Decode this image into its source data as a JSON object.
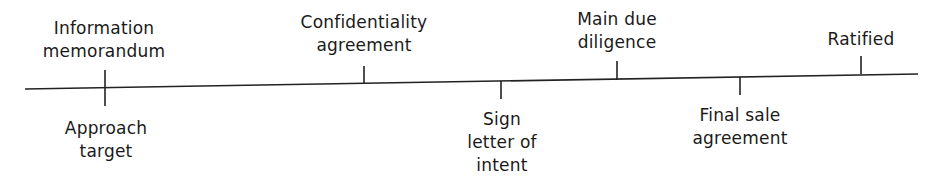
{
  "diagram": {
    "type": "timeline",
    "line": {
      "x1": 25,
      "y1": 89,
      "x2": 918,
      "y2": 74,
      "color": "#222222"
    },
    "events": [
      {
        "id": "approach-target",
        "label": "Approach\ntarget",
        "x": 105,
        "side": "below",
        "order": 1
      },
      {
        "id": "information-memorandum",
        "label": "Information\nmemorandum",
        "x": 105,
        "side": "above",
        "order": 2
      },
      {
        "id": "confidentiality-agreement",
        "label": "Confidentiality\nagreement",
        "x": 364,
        "side": "above",
        "order": 3
      },
      {
        "id": "sign-letter-of-intent",
        "label": "Sign\nletter of\nintent",
        "x": 501,
        "side": "below",
        "order": 4
      },
      {
        "id": "main-due-diligence",
        "label": "Main due\ndiligence",
        "x": 617,
        "side": "above",
        "order": 5
      },
      {
        "id": "final-sale-agreement",
        "label": "Final sale\nagreement",
        "x": 740,
        "side": "below",
        "order": 6
      },
      {
        "id": "ratified",
        "label": "Ratified",
        "x": 861,
        "side": "above",
        "order": 7
      }
    ]
  }
}
